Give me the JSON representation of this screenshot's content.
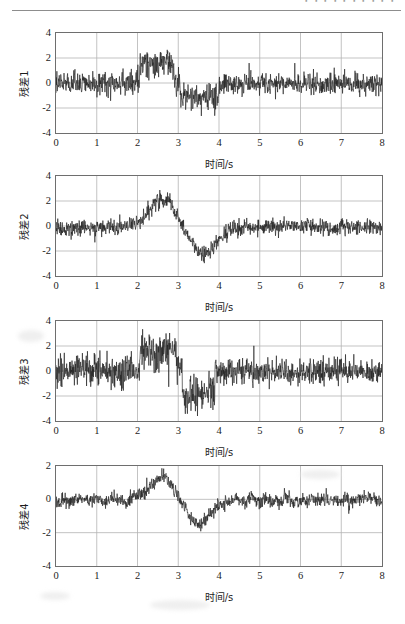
{
  "page": {
    "header_text": "・・・・・・・・・・",
    "background_color": "#ffffff"
  },
  "figure": {
    "line_color": "#222222",
    "grid_color": "#b4b4b4",
    "axis_color": "#6e6e6e",
    "subplot_count": 4
  },
  "chart_data": [
    {
      "type": "line",
      "title": "",
      "ylabel": "残差1",
      "xlabel": "时间/s",
      "xlim": [
        0,
        8
      ],
      "ylim": [
        -4,
        4
      ],
      "xticks": [
        "0",
        "1",
        "2",
        "3",
        "4",
        "5",
        "6",
        "7",
        "8"
      ],
      "yticks": [
        "4",
        "2",
        "0",
        "-2",
        "-4"
      ],
      "grid": true,
      "legend": "none",
      "series": [
        {
          "name": "残差1",
          "description": "noisy residual with step-like positive excursion 2.1-2.9 s and negative excursion 3.0-4.0 s",
          "noise_sigma": 0.42,
          "segments": [
            {
              "t0": 0.0,
              "t1": 2.05,
              "mean": 0.0,
              "sigma": 0.45
            },
            {
              "t0": 2.05,
              "t1": 2.9,
              "mean": 1.5,
              "sigma": 0.62
            },
            {
              "t0": 2.9,
              "t1": 3.05,
              "mean": 0.2,
              "sigma": 0.55
            },
            {
              "t0": 3.05,
              "t1": 4.0,
              "mean": -1.15,
              "sigma": 0.55
            },
            {
              "t0": 4.0,
              "t1": 8.0,
              "mean": -0.05,
              "sigma": 0.42
            }
          ]
        }
      ]
    },
    {
      "type": "line",
      "title": "",
      "ylabel": "残差2",
      "xlabel": "时间/s",
      "xlim": [
        0,
        8
      ],
      "ylim": [
        -4,
        4
      ],
      "xticks": [
        "0",
        "1",
        "2",
        "3",
        "4",
        "5",
        "6",
        "7",
        "8"
      ],
      "yticks": [
        "4",
        "2",
        "0",
        "-2",
        "-4"
      ],
      "grid": true,
      "legend": "none",
      "series": [
        {
          "name": "残差2",
          "description": "smooth positive bump peaking near +2.3 at 2.6 s followed by negative trough near -2.2 at 3.6 s",
          "noise_sigma": 0.3,
          "bumps": [
            {
              "center": 2.62,
              "width": 0.45,
              "amp": 2.25
            },
            {
              "center": 3.62,
              "width": 0.45,
              "amp": -2.1
            }
          ],
          "baseline": -0.1
        }
      ]
    },
    {
      "type": "line",
      "title": "",
      "ylabel": "残差3",
      "xlabel": "时间/s",
      "xlim": [
        0,
        8
      ],
      "ylim": [
        -4,
        4
      ],
      "xticks": [
        "0",
        "1",
        "2",
        "3",
        "4",
        "5",
        "6",
        "7",
        "8"
      ],
      "yticks": [
        "4",
        "2",
        "0",
        "-2",
        "-4"
      ],
      "grid": true,
      "legend": "none",
      "series": [
        {
          "name": "残差3",
          "description": "high-variance residual with positive burst 2.1-2.95 s peaking near +3.2 and negative burst 3.0-3.9 s reaching -3.3",
          "noise_sigma": 0.5,
          "segments": [
            {
              "t0": 0.0,
              "t1": 2.05,
              "mean": 0.0,
              "sigma": 0.62
            },
            {
              "t0": 2.05,
              "t1": 2.95,
              "mean": 1.6,
              "sigma": 0.72
            },
            {
              "t0": 2.95,
              "t1": 3.1,
              "mean": 0.3,
              "sigma": 0.6
            },
            {
              "t0": 3.1,
              "t1": 3.9,
              "mean": -1.8,
              "sigma": 0.75
            },
            {
              "t0": 3.9,
              "t1": 8.0,
              "mean": -0.05,
              "sigma": 0.5
            }
          ]
        }
      ]
    },
    {
      "type": "line",
      "title": "",
      "ylabel": "残差4",
      "xlabel": "时间/s",
      "xlim": [
        0,
        8
      ],
      "ylim": [
        -4,
        2
      ],
      "xticks": [
        "0",
        "1",
        "2",
        "3",
        "4",
        "5",
        "6",
        "7",
        "8"
      ],
      "yticks": [
        "2",
        "0",
        "-2",
        "-4"
      ],
      "grid": true,
      "legend": "none",
      "series": [
        {
          "name": "残差4",
          "description": "low amplitude residual, smooth positive hump to about +1.3 near 2.6 s then dip to about -1.5 near 3.5 s",
          "noise_sigma": 0.2,
          "bumps": [
            {
              "center": 2.6,
              "width": 0.42,
              "amp": 1.3
            },
            {
              "center": 3.5,
              "width": 0.4,
              "amp": -1.35
            }
          ],
          "baseline": -0.05
        }
      ]
    }
  ]
}
